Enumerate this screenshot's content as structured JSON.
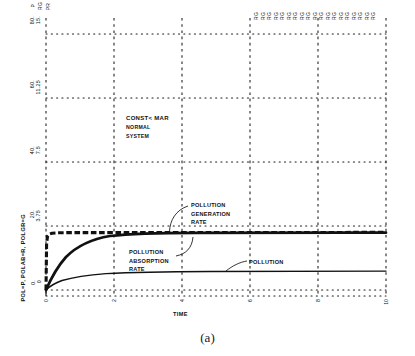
{
  "figure": {
    "caption": "(a)",
    "note": {
      "line1": "CONST< MAR",
      "line2": "NORMAL",
      "line3": "SYSTEM"
    }
  },
  "chart_data": {
    "type": "line",
    "title": "",
    "subtitle": "",
    "xlabel": "TIME",
    "ylabel": "POL=P, POLAB=R, POLGR=G",
    "xlim": [
      0,
      10
    ],
    "ylim": [
      0,
      80
    ],
    "grid": true,
    "grid_style": "dotted",
    "legend_position": "inline-annotations",
    "x_ticks": [
      "0",
      "2",
      "4",
      "6",
      "8",
      "10"
    ],
    "x_tick_values": [
      0,
      2,
      4,
      6,
      8,
      10
    ],
    "y_axis_left": {
      "label": "P",
      "ticks": [
        "0.",
        "20.",
        "40.",
        "60.",
        "80."
      ],
      "values": [
        0,
        20,
        40,
        60,
        80
      ]
    },
    "y_axis_right_scale": {
      "label": "RG",
      "ticks": [
        "0",
        "3.75",
        "7.5",
        "11.25",
        "15."
      ],
      "values": [
        0,
        3.75,
        7.5,
        11.25,
        15
      ]
    },
    "top_axis_marker": "PR",
    "top_strip_marker": "RG",
    "top_strip_count": 19,
    "annotations": [
      {
        "id": "pollution-generation-rate",
        "lines": [
          "POLLUTION",
          "GENERATION",
          "RATE"
        ],
        "points_to_series": "POLGR"
      },
      {
        "id": "pollution-absorption-rate",
        "lines": [
          "POLLUTION",
          "ABSORPTION",
          "RATE"
        ],
        "points_to_series": "POLAB"
      },
      {
        "id": "pollution",
        "lines": [
          "POLLUTION"
        ],
        "points_to_series": "POL"
      }
    ],
    "series": [
      {
        "name": "POLGR",
        "label": "POLLUTION GENERATION RATE",
        "symbol": "G",
        "style": "dashed-thick",
        "x": [
          0,
          0.05,
          0.1,
          0.2,
          0.3,
          0.5,
          1,
          2,
          3,
          4,
          5,
          6,
          7,
          8,
          9,
          10
        ],
        "y": [
          0,
          14.5,
          20.5,
          22.6,
          23.0,
          23.2,
          23.3,
          23.3,
          23.3,
          23.3,
          23.3,
          23.3,
          23.3,
          23.3,
          23.3,
          23.3
        ]
      },
      {
        "name": "POLAB",
        "label": "POLLUTION ABSORPTION RATE",
        "symbol": "R",
        "style": "solid-thick",
        "x": [
          0,
          0.2,
          0.4,
          0.6,
          0.8,
          1.0,
          1.4,
          1.8,
          2.2,
          2.6,
          3.0,
          3.5,
          4.0,
          4.5,
          5.0,
          6.0,
          7.0,
          8.0,
          9.0,
          10.0
        ],
        "y": [
          0,
          4.0,
          7.2,
          9.6,
          11.4,
          12.9,
          15.2,
          16.9,
          18.2,
          19.2,
          20.0,
          20.8,
          21.4,
          21.8,
          22.1,
          22.6,
          22.9,
          23.0,
          23.1,
          23.2
        ]
      },
      {
        "name": "POL",
        "label": "POLLUTION",
        "symbol": "P",
        "style": "solid-thin",
        "x": [
          0,
          0.3,
          0.6,
          1.0,
          1.5,
          2.0,
          2.5,
          3.0,
          4.0,
          5.0,
          6.0,
          7.0,
          8.0,
          9.0,
          10.0
        ],
        "y": [
          0,
          1.3,
          2.2,
          3.0,
          3.7,
          4.2,
          4.5,
          4.7,
          5.0,
          5.1,
          5.2,
          5.2,
          5.2,
          5.2,
          5.2
        ]
      }
    ]
  },
  "colors": {
    "ink": "#111111",
    "background": "#ffffff",
    "grid": "#1a1a1a"
  }
}
